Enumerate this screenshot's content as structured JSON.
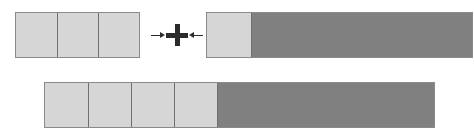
{
  "figure": {
    "kind": "fraction-bar-addition-diagram",
    "operator_symbols": {
      "arrow_right": "→",
      "plus": "+",
      "arrow_left": "←"
    },
    "colors": {
      "light_fill": "#d6d6d6",
      "dark_fill": "#808080",
      "outline": "#8a8a8a",
      "divider": "#6f6f6f",
      "symbol": "#2b2b2b",
      "background": "#ffffff"
    }
  },
  "chart_data": {
    "type": "bar",
    "title": "",
    "subtitle": "",
    "xlabel": "",
    "ylabel": "",
    "grid": false,
    "legend_position": "none",
    "orientation": "horizontal",
    "annotations": [
      {
        "symbol": "→",
        "meaning": "arrow-right"
      },
      {
        "symbol": "+",
        "meaning": "plus"
      },
      {
        "symbol": "←",
        "meaning": "arrow-left"
      }
    ],
    "categories": [
      "addend-1",
      "addend-2",
      "sum"
    ],
    "series": [
      {
        "name": "light-segments",
        "values": [
          3,
          1,
          4
        ]
      },
      {
        "name": "dark-segments",
        "values": [
          0,
          5,
          5
        ]
      }
    ],
    "bars": [
      {
        "name": "addend-1",
        "row": "top",
        "total_cells": 3,
        "light_cells": 3,
        "dark_cells": 0,
        "cell_width_px": 41,
        "x_px": 15,
        "y_px": 12,
        "width_px": 125,
        "height_px": 46
      },
      {
        "name": "addend-2",
        "row": "top",
        "total_cells": 6,
        "light_cells": 1,
        "dark_cells": 5,
        "cell_width_px": 44,
        "x_px": 206,
        "y_px": 12,
        "width_px": 267,
        "height_px": 46
      },
      {
        "name": "sum",
        "row": "bottom",
        "total_cells": 9,
        "light_cells": 4,
        "dark_cells": 5,
        "cell_width_px": 43,
        "x_px": 44,
        "y_px": 82,
        "width_px": 391,
        "height_px": 46
      }
    ],
    "values": [
      3,
      1,
      4
    ],
    "ylim": [
      0,
      9
    ]
  }
}
